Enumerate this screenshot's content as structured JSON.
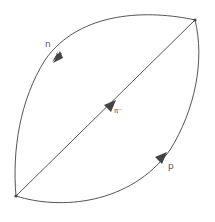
{
  "diagram": {
    "type": "feynman-loop",
    "vertices": [
      {
        "id": "v1",
        "x": 16,
        "y": 196
      },
      {
        "id": "v2",
        "x": 195,
        "y": 20
      }
    ],
    "lines": [
      {
        "id": "upper-arc",
        "label": "n",
        "direction": "v2-to-v1"
      },
      {
        "id": "diagonal",
        "label": "π⁻",
        "direction": "v1-to-v2"
      },
      {
        "id": "lower-arc",
        "label": "p",
        "direction": "v1-to-v2"
      }
    ],
    "labels": {
      "upper": "n",
      "middle": "π⁻",
      "lower": "p"
    },
    "colors": {
      "line": "#555555",
      "label": "#555555",
      "background": "#ffffff"
    }
  }
}
